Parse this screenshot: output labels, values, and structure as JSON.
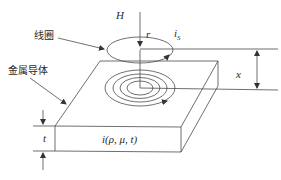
{
  "diagram": {
    "type": "eddy-current-probe-schematic",
    "labels": {
      "field": "H",
      "radius": "r",
      "coil_current_main": "i",
      "coil_current_sub": "S",
      "coil": "线圈",
      "conductor": "金属导体",
      "liftoff": "x",
      "thickness": "t",
      "eddy_current": "i(ρ, μ, t)"
    },
    "colors": {
      "line": "#4a4a4a",
      "text": "#2a2a2a",
      "background": "#ffffff"
    }
  }
}
